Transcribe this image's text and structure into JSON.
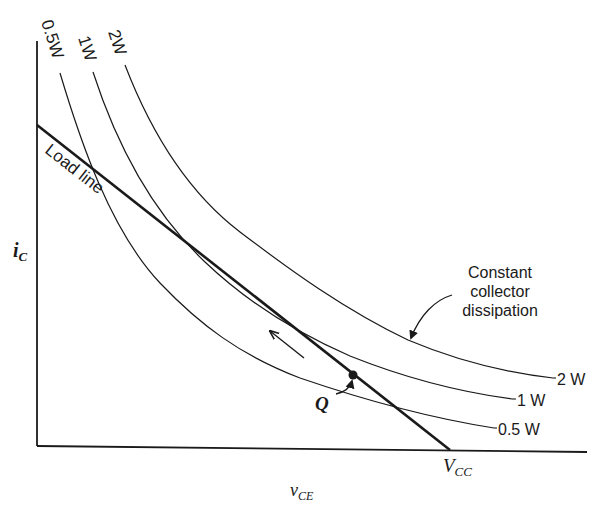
{
  "figure": {
    "type": "transistor load line with constant collector dissipation hyperbolas",
    "axes": {
      "x_label": "v",
      "x_label_sub": "CE",
      "y_label": "i",
      "y_label_sub": "C",
      "origin": [
        37,
        446
      ],
      "x_end": [
        587,
        452
      ],
      "y_top": [
        37,
        41
      ]
    },
    "load_line": {
      "label": "Load line",
      "start": [
        37,
        125
      ],
      "end": [
        450,
        450
      ],
      "end_label": "V",
      "end_label_sub": "CC"
    },
    "q_point": {
      "label": "Q",
      "position": [
        353,
        375
      ]
    },
    "direction_arrow": {
      "from": [
        304,
        358
      ],
      "to": [
        269,
        330
      ]
    },
    "curves": [
      {
        "name": "0.5W",
        "top_label": "0.5W",
        "right_label": "0.5 W"
      },
      {
        "name": "1W",
        "top_label": "1W",
        "right_label": "1 W"
      },
      {
        "name": "2W",
        "top_label": "2W",
        "right_label": "2 W"
      }
    ],
    "annotation": {
      "line1": "Constant",
      "line2": "collector",
      "line3": "dissipation"
    },
    "colors": {
      "ink": "#1a1a1a",
      "background": "#ffffff"
    }
  }
}
